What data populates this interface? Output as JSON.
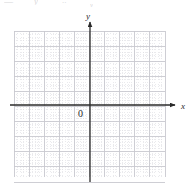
{
  "page": {
    "width": 196,
    "height": 194,
    "background": "#ffffff"
  },
  "header_fragments": {
    "frag_a": "—",
    "frag_b": "y",
    "frag_c": "..",
    "frag_d": "v"
  },
  "graph": {
    "origin_label": "0",
    "x_axis_label": "x",
    "y_axis_label": "y",
    "axis_color": "#2a2a2a",
    "major_grid_color": "#c9c9cf",
    "minor_grid_color": "#d8d8de",
    "plot": {
      "left": 14,
      "top": 31,
      "right": 165,
      "bottom": 177,
      "origin_x": 90,
      "origin_y": 105,
      "major_step": 15.1,
      "minor_per_major": 5,
      "cells_x": 10,
      "cells_y": 10,
      "cells_left_of_axis": 5,
      "cells_right_of_axis": 5,
      "cells_above_axis": 5,
      "cells_below_axis": 5
    },
    "x_axis": {
      "start": 10,
      "end": 175,
      "arrow": "right"
    },
    "y_axis": {
      "start": 182,
      "end": 22,
      "arrow": "up"
    }
  },
  "chart_data": {
    "type": "scatter",
    "title": "",
    "xlabel": "x",
    "ylabel": "y",
    "xlim": [
      -5,
      5
    ],
    "ylim": [
      -5,
      5
    ],
    "xticks": [
      -5,
      -4,
      -3,
      -2,
      -1,
      0,
      1,
      2,
      3,
      4,
      5
    ],
    "yticks": [
      -5,
      -4,
      -3,
      -2,
      -1,
      0,
      1,
      2,
      3,
      4,
      5
    ],
    "xticklabels": [
      "",
      "",
      "",
      "",
      "",
      "0",
      "",
      "",
      "",
      "",
      ""
    ],
    "yticklabels": [
      "",
      "",
      "",
      "",
      "",
      "",
      "",
      "",
      "",
      "",
      ""
    ],
    "grid": true,
    "minor_grid": true,
    "legend": null,
    "series": [],
    "annotations": [
      {
        "text": "0",
        "x": -0.7,
        "y": -0.65
      },
      {
        "text": "x",
        "x": 6.1,
        "y": 0.4
      },
      {
        "text": "y",
        "x": -0.3,
        "y": 6.3
      }
    ]
  }
}
